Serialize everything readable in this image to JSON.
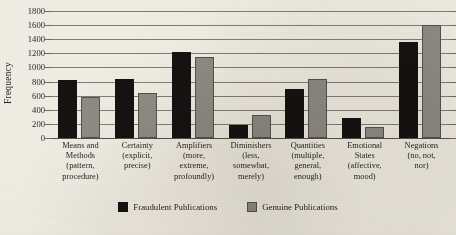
{
  "chart_data": {
    "type": "bar",
    "title": "",
    "xlabel": "",
    "ylabel": "Frequency",
    "ylim": [
      0,
      1800
    ],
    "ytick_step": 200,
    "yticks": [
      0,
      200,
      400,
      600,
      800,
      1000,
      1200,
      1400,
      1600,
      1800
    ],
    "grid": true,
    "legend_position": "bottom-center",
    "categories": [
      "Means and Methods (pattern, procedure)",
      "Certainty (explicit, precise)",
      "Amplifiers (more, extreme, profoundly)",
      "Diminishers (less, somewhat, merely)",
      "Quantities (multiple, general, enough)",
      "Emotional States (affective, mood)",
      "Negations (no, not, nor)"
    ],
    "category_lines": [
      [
        "Means and",
        "Methods",
        "(pattern,",
        "procedure)"
      ],
      [
        "Certainty",
        "(explicit,",
        "precise)"
      ],
      [
        "Amplifiers",
        "(more,",
        "extreme,",
        "profoundly)"
      ],
      [
        "Diminishers",
        "(less,",
        "somewhat,",
        "merely)"
      ],
      [
        "Quantities",
        "(multiple,",
        "general,",
        "enough)"
      ],
      [
        "Emotional",
        "States",
        "(affective,",
        "mood)"
      ],
      [
        "Negations",
        "(no, not,",
        "nor)"
      ]
    ],
    "series": [
      {
        "name": "Fraudulent Publications",
        "color": "#151312",
        "values": [
          820,
          835,
          1215,
          190,
          700,
          290,
          1355
        ]
      },
      {
        "name": "Genuine Publications",
        "color": "#8e8b85",
        "values": [
          575,
          640,
          1150,
          330,
          830,
          150,
          1600
        ]
      }
    ]
  },
  "legend": {
    "items": [
      {
        "label": "Fraudulent Publications",
        "swatch": "fraudulent"
      },
      {
        "label": "Genuine Publications",
        "swatch": "genuine"
      }
    ]
  }
}
